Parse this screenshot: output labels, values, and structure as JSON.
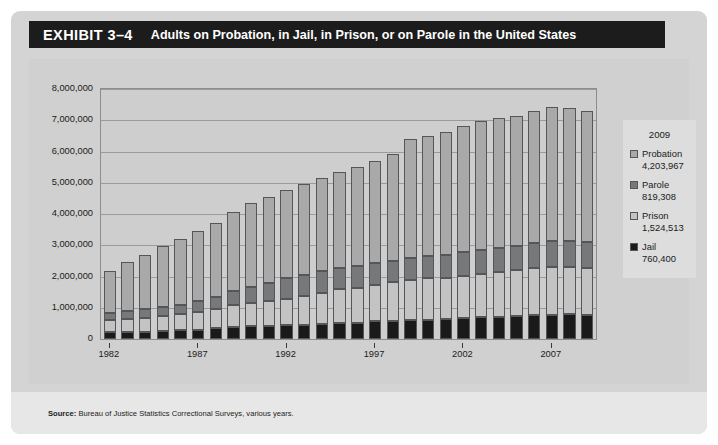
{
  "exhibit": {
    "number": "EXHIBIT 3–4",
    "title": "Adults on Probation, in Jail, in Prison, or on Parole in the United States"
  },
  "source": {
    "label": "Source:",
    "text": " Bureau of Justice Statistics Correctional Surveys, various years."
  },
  "legend": {
    "year": "2009",
    "items": [
      {
        "label": "Probation",
        "value": "4,203,967",
        "color": "#a8a9a8"
      },
      {
        "label": "Parole",
        "value": "819,308",
        "color": "#77787a"
      },
      {
        "label": "Prison",
        "value": "1,524,513",
        "color": "#c2c3c2"
      },
      {
        "label": "Jail",
        "value": "760,400",
        "color": "#1a1a1a"
      }
    ]
  },
  "chart_data": {
    "type": "bar",
    "title": "Adults on Probation, in Jail, in Prison, or on Parole in the United States",
    "subtype": "stacked-vertical",
    "xlabel": "",
    "ylabel": "",
    "ylim": [
      0,
      8000000
    ],
    "ytick_labels": [
      "8,000,000",
      "7,000,000",
      "6,000,000",
      "5,000,000",
      "4,000,000",
      "3,000,000",
      "2,000,000",
      "1,000,000",
      "0"
    ],
    "ytick_values": [
      8000000,
      7000000,
      6000000,
      5000000,
      4000000,
      3000000,
      2000000,
      1000000,
      0
    ],
    "grid": true,
    "legend_position": "right-outside",
    "stack_order_bottom_to_top": [
      "Jail",
      "Prison",
      "Parole",
      "Probation"
    ],
    "categories": [
      1982,
      1983,
      1984,
      1985,
      1986,
      1987,
      1988,
      1989,
      1990,
      1991,
      1992,
      1993,
      1994,
      1995,
      1996,
      1997,
      1998,
      1999,
      2000,
      2001,
      2002,
      2003,
      2004,
      2005,
      2006,
      2007,
      2008,
      2009
    ],
    "xtick_labels": [
      "1982",
      "1987",
      "1992",
      "1997",
      "2002",
      "2007"
    ],
    "xtick_categories": [
      1982,
      1987,
      1992,
      1997,
      2002,
      2007
    ],
    "series": [
      {
        "name": "Jail",
        "color": "#1a1a1a",
        "values": [
          210000,
          223000,
          234000,
          256000,
          274000,
          295000,
          343000,
          395000,
          405000,
          426000,
          444000,
          459000,
          486000,
          507000,
          518000,
          567000,
          592000,
          605000,
          621000,
          631000,
          665000,
          691000,
          714000,
          747000,
          766000,
          780000,
          785000,
          760400
        ]
      },
      {
        "name": "Prison",
        "color": "#c2c3c2",
        "values": [
          402000,
          423000,
          448000,
          481000,
          522000,
          560000,
          603000,
          680000,
          743000,
          792000,
          850000,
          909000,
          990000,
          1078000,
          1127000,
          1176000,
          1224000,
          1287000,
          1316000,
          1330000,
          1367000,
          1390000,
          1421000,
          1448000,
          1492000,
          1517000,
          1518000,
          1524513
        ]
      },
      {
        "name": "Parole",
        "color": "#77787a",
        "values": [
          224000,
          246000,
          266000,
          277000,
          300000,
          355000,
          407000,
          456000,
          531000,
          590000,
          658000,
          676000,
          690000,
          679000,
          679000,
          694000,
          696000,
          714000,
          724000,
          732000,
          750000,
          774000,
          772000,
          784000,
          799000,
          824000,
          828000,
          819308
        ]
      },
      {
        "name": "Probation",
        "color": "#a8a9a8",
        "values": [
          1335000,
          1582000,
          1740000,
          1969000,
          2114000,
          2247000,
          2356000,
          2522000,
          2670000,
          2729000,
          2812000,
          2903000,
          2981000,
          3078000,
          3165000,
          3261000,
          3417000,
          3779000,
          3839000,
          3932000,
          4024000,
          4120000,
          4151000,
          4162000,
          4237000,
          4293000,
          4271000,
          4203967
        ]
      }
    ]
  }
}
